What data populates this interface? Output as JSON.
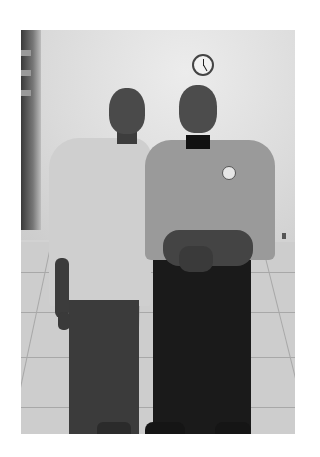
{
  "image": {
    "description": "Grayscale photo of two smiling men standing side by side in a room with a wall clock and tiled floor",
    "style": "black-and-white photograph",
    "subjects": [
      {
        "position": "left",
        "attire": "light short-sleeve button-up shirt, dark trousers, glasses, wristwatch"
      },
      {
        "position": "right",
        "attire": "uniform shirt with shoulder epaulets and badge patch, black trousers, wristwatch, hands clasped"
      }
    ],
    "background": [
      "wall clock",
      "plain wall",
      "tiled floor",
      "dark door frame at left"
    ]
  }
}
